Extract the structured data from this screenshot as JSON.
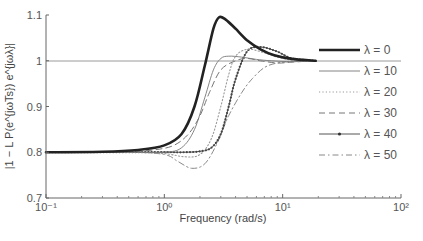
{
  "chart_data": {
    "type": "line",
    "title": "",
    "xlabel": "Frequency (rad/s)",
    "ylabel": "|1 − L P(e^{jωTs}) e^{jωλ}|",
    "xscale": "log",
    "xlim": [
      0.1,
      100
    ],
    "ylim": [
      0.7,
      1.1
    ],
    "x_ticks": [
      0.1,
      1,
      10,
      100
    ],
    "x_tick_labels": [
      "10⁻¹",
      "10⁰",
      "10¹",
      "10²"
    ],
    "y_ticks": [
      0.7,
      0.8,
      0.9,
      1,
      1.1
    ],
    "y_tick_labels": [
      "0.7",
      "0.8",
      "0.9",
      "1",
      "1.1"
    ],
    "reference_line": {
      "y": 1.0,
      "color": "#999999"
    },
    "grid": false,
    "legend_position": "right",
    "series": [
      {
        "name": "λ = 0",
        "style": "thick-solid",
        "x": [
          0.1,
          0.3,
          0.6,
          1.0,
          1.4,
          1.8,
          2.2,
          2.6,
          2.9,
          3.3,
          4.0,
          5.0,
          6.5,
          8.5,
          12,
          19
        ],
        "values": [
          0.8,
          0.801,
          0.805,
          0.815,
          0.84,
          0.9,
          0.99,
          1.07,
          1.095,
          1.09,
          1.07,
          1.045,
          1.025,
          1.012,
          1.004,
          1.0
        ]
      },
      {
        "name": "λ = 10",
        "style": "thin-solid",
        "x": [
          0.1,
          0.5,
          1.0,
          1.4,
          1.8,
          2.2,
          2.6,
          3.0,
          3.5,
          4.5,
          6.0,
          8.0,
          12,
          19
        ],
        "values": [
          0.8,
          0.8,
          0.8,
          0.81,
          0.85,
          0.92,
          0.98,
          1.005,
          1.01,
          1.008,
          1.003,
          1.0,
          0.998,
          1.0
        ]
      },
      {
        "name": "λ = 20",
        "style": "dotted",
        "x": [
          0.1,
          0.5,
          1.0,
          1.5,
          2.0,
          2.5,
          3.0,
          3.5,
          4.0,
          5.0,
          6.5,
          9,
          13,
          19
        ],
        "values": [
          0.8,
          0.8,
          0.797,
          0.79,
          0.795,
          0.83,
          0.9,
          0.97,
          1.01,
          1.025,
          1.02,
          1.008,
          1.0,
          1.0
        ]
      },
      {
        "name": "λ = 30",
        "style": "dashed",
        "x": [
          0.1,
          0.4,
          0.8,
          1.2,
          1.6,
          2.0,
          2.4,
          3.0,
          4.0,
          5.0,
          6.5,
          9,
          12,
          19
        ],
        "values": [
          0.8,
          0.8,
          0.805,
          0.815,
          0.84,
          0.88,
          0.93,
          0.98,
          1.0,
          1.005,
          1.0,
          0.995,
          0.997,
          1.0
        ]
      },
      {
        "name": "λ = 40",
        "style": "solid-with-markers",
        "x": [
          0.1,
          0.5,
          1.0,
          1.5,
          2.0,
          2.5,
          3.0,
          3.5,
          4.0,
          5.0,
          6.5,
          9,
          12,
          19
        ],
        "values": [
          0.8,
          0.8,
          0.8,
          0.8,
          0.802,
          0.81,
          0.84,
          0.9,
          0.96,
          1.02,
          1.03,
          1.02,
          1.005,
          1.0
        ]
      },
      {
        "name": "λ = 50",
        "style": "dash-dot",
        "x": [
          0.1,
          0.5,
          1.0,
          1.3,
          1.7,
          2.2,
          2.8,
          3.5,
          4.5,
          5.5,
          7,
          9,
          12,
          19
        ],
        "values": [
          0.8,
          0.8,
          0.795,
          0.78,
          0.765,
          0.775,
          0.82,
          0.88,
          0.93,
          0.96,
          0.985,
          0.995,
          0.998,
          1.0
        ]
      }
    ]
  },
  "legend": {
    "items": [
      {
        "label": "λ = 0"
      },
      {
        "label": "λ = 10"
      },
      {
        "label": "λ = 20"
      },
      {
        "label": "λ = 30"
      },
      {
        "label": "λ = 40"
      },
      {
        "label": "λ = 50"
      }
    ]
  }
}
